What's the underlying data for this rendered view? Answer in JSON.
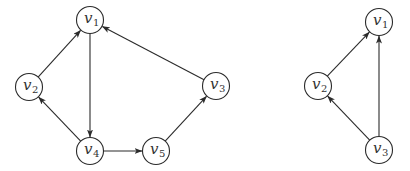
{
  "graphs": [
    {
      "name": "left-graph",
      "nodes": [
        {
          "id": "v1",
          "base": "v",
          "sub": "1",
          "x": 90,
          "y": 20
        },
        {
          "id": "v2",
          "base": "v",
          "sub": "2",
          "x": 29,
          "y": 87
        },
        {
          "id": "v3",
          "base": "v",
          "sub": "3",
          "x": 216,
          "y": 86
        },
        {
          "id": "v4",
          "base": "v",
          "sub": "4",
          "x": 90,
          "y": 151
        },
        {
          "id": "v5",
          "base": "v",
          "sub": "5",
          "x": 156,
          "y": 151
        }
      ],
      "edges": [
        {
          "from": "v2",
          "to": "v1"
        },
        {
          "from": "v3",
          "to": "v1"
        },
        {
          "from": "v1",
          "to": "v4"
        },
        {
          "from": "v4",
          "to": "v2"
        },
        {
          "from": "v4",
          "to": "v5"
        },
        {
          "from": "v5",
          "to": "v3"
        }
      ]
    },
    {
      "name": "right-graph",
      "nodes": [
        {
          "id": "v1",
          "base": "v",
          "sub": "1",
          "x": 379,
          "y": 22
        },
        {
          "id": "v2",
          "base": "v",
          "sub": "2",
          "x": 318,
          "y": 86
        },
        {
          "id": "v3",
          "base": "v",
          "sub": "3",
          "x": 379,
          "y": 150
        }
      ],
      "edges": [
        {
          "from": "v2",
          "to": "v1"
        },
        {
          "from": "v3",
          "to": "v1"
        },
        {
          "from": "v3",
          "to": "v2"
        }
      ]
    }
  ],
  "style": {
    "node_radius": 13.5,
    "stroke_color": "#2b2b2b",
    "label_color": "#333333"
  }
}
